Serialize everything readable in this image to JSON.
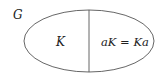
{
  "diagram": {
    "set_label": "G",
    "left_region_label": "K",
    "right_region_label": "aK = Ka",
    "stroke_color": "#555555"
  }
}
